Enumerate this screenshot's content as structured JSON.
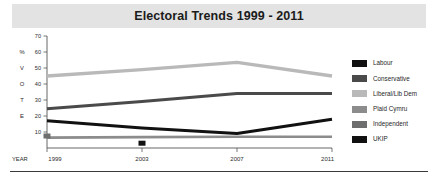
{
  "title": "Electoral Trends 1999 - 2011",
  "axis": {
    "y_label_letters": [
      "%",
      "V",
      "O",
      "T",
      "E"
    ],
    "y_ticks": [
      70,
      60,
      50,
      40,
      30,
      20,
      10
    ],
    "x_label": "YEAR",
    "x_ticks": [
      "1999",
      "2003",
      "2007",
      "2011"
    ]
  },
  "legend": {
    "items": [
      {
        "label": "Labour",
        "color": "#111111"
      },
      {
        "label": "Conservative",
        "color": "#4a4a4a"
      },
      {
        "label": "Liberal/Lib Dem",
        "color": "#b9b9b9"
      },
      {
        "label": "Plaid Cymru",
        "color": "#8c8c8c"
      },
      {
        "label": "Independent",
        "color": "#6e6e6e"
      },
      {
        "label": "UKIP",
        "color": "#111111"
      }
    ]
  },
  "chart_data": {
    "type": "line",
    "title": "Electoral Trends 1999 - 2011",
    "xlabel": "YEAR",
    "ylabel": "% VOTE",
    "categories": [
      1999,
      2003,
      2007,
      2011
    ],
    "ylim": [
      0,
      70
    ],
    "xlim": [
      1999,
      2011
    ],
    "grid": false,
    "legend_position": "right",
    "series": [
      {
        "name": "Liberal/Lib Dem",
        "color": "#b9b9b9",
        "values": [
          45,
          49,
          53.5,
          45
        ]
      },
      {
        "name": "Conservative",
        "color": "#4a4a4a",
        "values": [
          24.5,
          29,
          34,
          34
        ]
      },
      {
        "name": "Labour",
        "color": "#111111",
        "values": [
          17,
          12.5,
          9,
          18
        ]
      },
      {
        "name": "Plaid Cymru",
        "color": "#8c8c8c",
        "values": [
          6.5,
          6.8,
          7,
          7
        ]
      },
      {
        "name": "Independent",
        "color": "#6e6e6e",
        "values": [
          7.5,
          null,
          null,
          null
        ]
      },
      {
        "name": "UKIP",
        "color": "#111111",
        "values": [
          null,
          3,
          null,
          null
        ]
      }
    ]
  }
}
